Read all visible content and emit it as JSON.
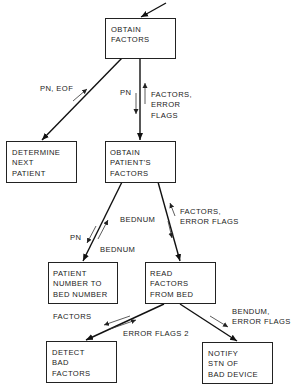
{
  "diagram": {
    "type": "structure-chart",
    "modules": [
      {
        "id": "obtain_factors",
        "lines": [
          "OBTAIN",
          "FACTORS"
        ]
      },
      {
        "id": "determine_next_patient",
        "lines": [
          "DETERMINE",
          "NEXT",
          "PATIENT"
        ]
      },
      {
        "id": "obtain_patients_factors",
        "lines": [
          "OBTAIN",
          "PATIENT'S",
          "FACTORS"
        ]
      },
      {
        "id": "patient_number_to_bed_number",
        "lines": [
          "PATIENT",
          "NUMBER TO",
          "BED NUMBER"
        ]
      },
      {
        "id": "read_factors_from_bed",
        "lines": [
          "READ",
          "FACTORS",
          "FROM BED"
        ]
      },
      {
        "id": "detect_bad_factors",
        "lines": [
          "DETECT",
          "BAD",
          "FACTORS"
        ]
      },
      {
        "id": "notify_stn_of_bad_device",
        "lines": [
          "NOTIFY",
          "STN OF",
          "BAD DEVICE"
        ]
      }
    ],
    "flow_labels": {
      "pn_eof": "PN, EOF",
      "pn_down": "PN",
      "factors_error_flags_1": [
        "FACTORS,",
        "ERROR",
        "FLAGS"
      ],
      "pn_left": "PN",
      "bednum_up": "BEDNUM",
      "bednum_left": "BEDNUM",
      "factors_error_flags_2": [
        "FACTORS,",
        "ERROR FLAGS"
      ],
      "factors_detect": "FACTORS",
      "error_flags_2": "ERROR FLAGS 2",
      "bendum_error_flags": [
        "BENDUM,",
        "ERROR FLAGS"
      ]
    }
  }
}
